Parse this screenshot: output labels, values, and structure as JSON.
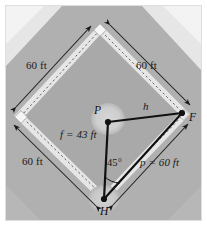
{
  "figure": {
    "type": "geometry-diagram",
    "vertices": [
      {
        "id": "P",
        "label": "P",
        "role": "pitchers-mound",
        "x": 108,
        "y": 122
      },
      {
        "id": "F",
        "label": "F",
        "role": "first-base",
        "x": 182,
        "y": 113
      },
      {
        "id": "H",
        "label": "H",
        "role": "home-plate",
        "x": 104,
        "y": 199
      }
    ],
    "segments": [
      {
        "id": "h",
        "label": "h",
        "from": "P",
        "to": "F",
        "known": false
      },
      {
        "id": "f",
        "label": "f = 43 ft",
        "from": "P",
        "to": "H",
        "known": true,
        "value": 43,
        "unit": "ft"
      },
      {
        "id": "p",
        "label": "p = 60 ft",
        "from": "H",
        "to": "F",
        "known": true,
        "value": 60,
        "unit": "ft"
      }
    ],
    "angles": [
      {
        "at": "H",
        "label": "45°",
        "value": 45,
        "unit": "deg"
      }
    ],
    "base_paths": [
      {
        "id": "home-to-third",
        "label": "60 ft",
        "value": 60,
        "unit": "ft"
      },
      {
        "id": "third-to-second",
        "label": "60 ft",
        "value": 60,
        "unit": "ft"
      },
      {
        "id": "second-to-first",
        "label": "60 ft",
        "value": 60,
        "unit": "ft"
      }
    ],
    "labels": {
      "top_left_distance": "60 ft",
      "top_right_distance": "60 ft",
      "bottom_left_distance": "60 ft",
      "side_f": "f = 43 ft",
      "side_p": "p = 60 ft",
      "side_h": "h",
      "angle_h": "45°",
      "vertex_p": "P",
      "vertex_f": "F",
      "vertex_h": "H"
    },
    "colors": {
      "outfield_grass": "#b0b0b0",
      "infield_dirt": "#a8a8a8",
      "baseline_chalk": "#e4e4e4",
      "photo_border": "#d8d8d8",
      "line_stroke": "#111111",
      "page_background": "#ffffff",
      "mound_highlight": "#d2d2d2"
    }
  }
}
